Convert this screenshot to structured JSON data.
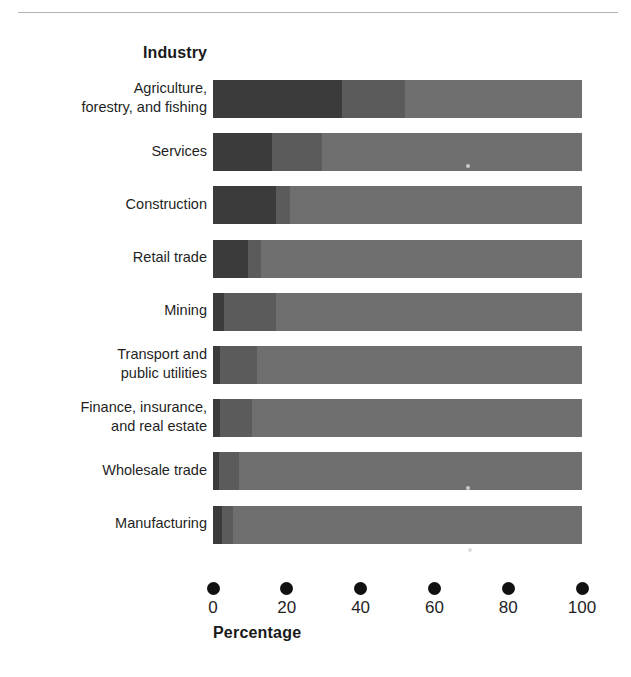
{
  "chart_data": {
    "type": "bar",
    "orientation": "horizontal",
    "stacked": true,
    "normalized": true,
    "title": "",
    "xlabel": "Percentage",
    "ylabel": "Industry",
    "xlim": [
      0,
      100
    ],
    "xticks": [
      0,
      20,
      40,
      60,
      80,
      100
    ],
    "xtick_labels": [
      "0",
      "20",
      "40",
      "60",
      "80",
      "100"
    ],
    "grid": false,
    "legend": "none",
    "categories": [
      "Agriculture, forestry, and fishing",
      "Services",
      "Construction",
      "Retail trade",
      "Mining",
      "Transport and public utilities",
      "Finance, insurance, and real estate",
      "Wholesale trade",
      "Manufacturing"
    ],
    "series": [
      {
        "name": "segment-1",
        "color": "#3b3b3b",
        "values": [
          35,
          16,
          17,
          9.5,
          3,
          2,
          2,
          1.5,
          2.5
        ]
      },
      {
        "name": "segment-2",
        "color": "#5b5b5b",
        "values": [
          17,
          13.5,
          4,
          3.5,
          14,
          10,
          8.5,
          5.5,
          3
        ]
      },
      {
        "name": "segment-3",
        "color": "#6f6f6f",
        "values": [
          48,
          70.5,
          79,
          87,
          83,
          88,
          89.5,
          93,
          94.5
        ]
      }
    ]
  },
  "axis": {
    "y_title": "Industry",
    "x_title": "Percentage"
  },
  "labels": {
    "rows": [
      {
        "lines": [
          "Agriculture,",
          "forestry, and fishing"
        ]
      },
      {
        "lines": [
          "Services"
        ]
      },
      {
        "lines": [
          "Construction"
        ]
      },
      {
        "lines": [
          "Retail trade"
        ]
      },
      {
        "lines": [
          "Mining"
        ]
      },
      {
        "lines": [
          "Transport and",
          "public utilities"
        ]
      },
      {
        "lines": [
          "Finance, insurance,",
          "and real estate"
        ]
      },
      {
        "lines": [
          "Wholesale trade"
        ]
      },
      {
        "lines": [
          "Manufacturing"
        ]
      }
    ]
  },
  "colors": {
    "segment_dark": "#3b3b3b",
    "segment_medium": "#5b5b5b",
    "segment_light": "#6f6f6f",
    "tick": "#111111",
    "text": "#1f1f1f",
    "background": "#ffffff"
  }
}
